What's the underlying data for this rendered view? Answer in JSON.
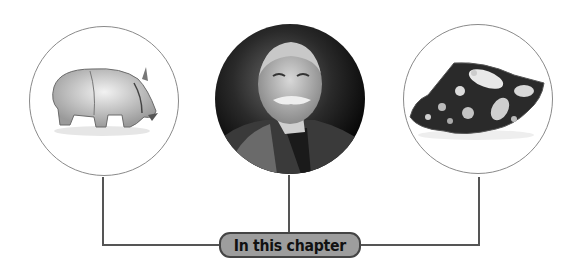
{
  "badge": {
    "label": "In this chapter",
    "fill": "#9d9d9d",
    "border": "#444444"
  },
  "images": [
    {
      "name": "rhino-sculpture",
      "description": "small rhinoceros figurine on white background",
      "style": "outlined circle"
    },
    {
      "name": "portrait",
      "description": "black-and-white portrait of elderly man with white moustache",
      "style": "filled circle"
    },
    {
      "name": "rock-specimen",
      "description": "dark rock with white clasts (breccia)",
      "style": "outlined circle"
    }
  ],
  "connector_color": "#555555"
}
